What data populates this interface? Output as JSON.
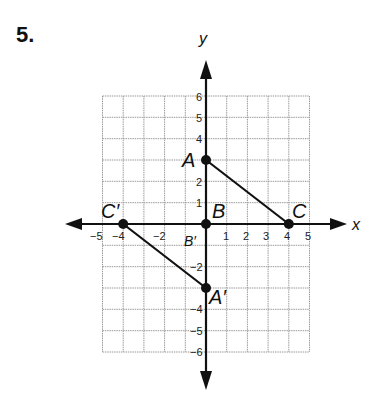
{
  "problem": {
    "number": "5."
  },
  "axes": {
    "x_label": "x",
    "y_label": "y"
  },
  "grid": {
    "xmin": -5,
    "xmax": 5,
    "ymin": -6,
    "ymax": 6
  },
  "x_ticks": [
    "−5",
    "−4",
    "−2",
    "1",
    "2",
    "3",
    "4",
    "5"
  ],
  "y_ticks": [
    "6",
    "5",
    "4",
    "2",
    "1",
    "−2",
    "−4",
    "−5",
    "−6"
  ],
  "points": {
    "A": {
      "label": "A",
      "x": 0,
      "y": 3
    },
    "B": {
      "label": "B",
      "x": 0,
      "y": 0
    },
    "C": {
      "label": "C",
      "x": 4,
      "y": 0
    },
    "A_prime": {
      "label": "A′",
      "x": 0,
      "y": -3
    },
    "B_prime": {
      "label": "B′",
      "x": 0,
      "y": 0
    },
    "C_prime": {
      "label": "C′",
      "x": -4,
      "y": 0
    }
  },
  "segments": [
    [
      "A",
      "C"
    ],
    [
      "C_prime",
      "A_prime"
    ]
  ],
  "colors": {
    "grid": "#9a9a9a",
    "axis": "#111111",
    "point": "#111111"
  }
}
